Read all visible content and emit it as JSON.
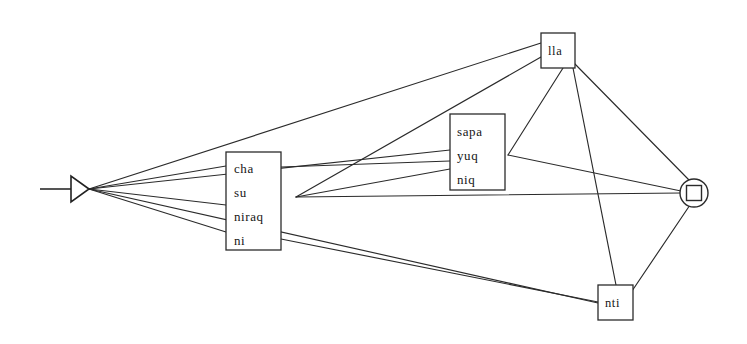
{
  "diagram": {
    "background_color": "#ffffff",
    "line_color": "#2b2b2b",
    "text_color": "#161616",
    "start_marker": {
      "name": "start-triangle-marker",
      "shape": "left-pointing-filled-triangle-with-tail",
      "apex_x": 89,
      "apex_y": 189,
      "base_x": 71,
      "tail_start_x": 40
    },
    "end_marker": {
      "name": "end-state-marker",
      "shape": "circle-enclosing-square",
      "cx": 694,
      "cy": 193,
      "r": 14,
      "square_size": 15
    },
    "nodes": [
      {
        "id": "cha",
        "label_lines": [
          "cha",
          "su",
          "niraq",
          "ni"
        ],
        "x": 226,
        "y": 152,
        "width": 55,
        "height": 98,
        "line_height": 24,
        "text_x": 234,
        "text_first_y": 173
      },
      {
        "id": "sapa",
        "label_lines": [
          "sapa",
          "yuq",
          "niq"
        ],
        "x": 450,
        "y": 114,
        "width": 55,
        "height": 76,
        "line_height": 24,
        "text_x": 457,
        "text_first_y": 136
      },
      {
        "id": "lla",
        "label_lines": [
          "lla"
        ],
        "x": 541,
        "y": 33,
        "width": 34,
        "height": 35,
        "line_height": 20,
        "text_x": 548,
        "text_first_y": 55
      },
      {
        "id": "nti",
        "label_lines": [
          "nti"
        ],
        "x": 598,
        "y": 285,
        "width": 35,
        "height": 35,
        "line_height": 20,
        "text_x": 605,
        "text_first_y": 307
      }
    ],
    "junctions": [
      {
        "id": "left-fan",
        "x": 89,
        "y": 189
      },
      {
        "id": "cha-right-fan",
        "x": 296,
        "y": 197
      },
      {
        "id": "sapa-right-fan",
        "x": 508,
        "y": 155
      },
      {
        "id": "end-fan",
        "x": 681,
        "y": 193
      }
    ],
    "edges": [
      {
        "id": "start-to-lla",
        "from": "left-fan",
        "to": "lla",
        "d": "M 89 189 L 541 43"
      },
      {
        "id": "start-to-cha-top",
        "from": "left-fan",
        "to": "cha",
        "d": "M 89 189 L 226 166"
      },
      {
        "id": "start-to-cha-mid",
        "from": "left-fan",
        "to": "cha",
        "d": "M 89 189 L 226 205"
      },
      {
        "id": "start-to-cha-bottom",
        "from": "left-fan",
        "to": "cha",
        "d": "M 89 189 L 226 232"
      },
      {
        "id": "start-to-sapa",
        "from": "left-fan",
        "to": "sapa",
        "d": "M 89 189 L 450 150"
      },
      {
        "id": "start-to-nti",
        "from": "left-fan",
        "to": "nti",
        "d": "M 89 189 L 598 303"
      },
      {
        "id": "cha-to-lla",
        "from": "cha-right-fan",
        "to": "lla",
        "d": "M 296 197 L 541 57"
      },
      {
        "id": "cha-to-sapa-top",
        "from": "cha",
        "to": "sapa",
        "d": "M 281 167 L 450 161"
      },
      {
        "id": "cha-to-sapa-mid",
        "from": "cha-right-fan",
        "to": "sapa",
        "d": "M 296 197 L 450 169"
      },
      {
        "id": "cha-to-end",
        "from": "cha-right-fan",
        "to": "end-fan",
        "d": "M 296 197 L 681 193"
      },
      {
        "id": "cha-to-nti",
        "from": "cha",
        "to": "nti",
        "d": "M 281 239 L 598 302"
      },
      {
        "id": "sapa-to-lla",
        "from": "sapa-right-fan",
        "to": "lla",
        "d": "M 508 155 L 563 68"
      },
      {
        "id": "sapa-to-end",
        "from": "sapa-right-fan",
        "to": "end-fan",
        "d": "M 508 155 L 681 191"
      },
      {
        "id": "lla-to-nti",
        "from": "lla",
        "to": "nti",
        "d": "M 573 68 L 616 285"
      },
      {
        "id": "lla-to-end",
        "from": "lla",
        "to": "end-fan",
        "d": "M 574 63 L 689 180"
      },
      {
        "id": "nti-to-end",
        "from": "nti",
        "to": "end-fan",
        "d": "M 632 291 L 690 205"
      }
    ]
  }
}
